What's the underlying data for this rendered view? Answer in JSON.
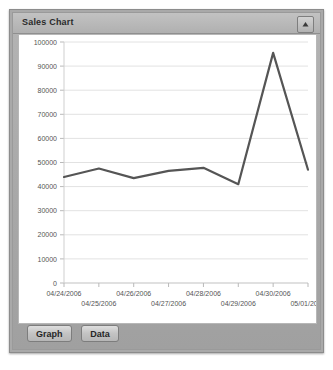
{
  "window": {
    "title": "Sales Chart",
    "collapse_icon": "collapse-up-icon"
  },
  "toolbar": {
    "graph_label": "Graph",
    "data_label": "Data"
  },
  "chart_data": {
    "type": "line",
    "title": "Sales Chart",
    "xlabel": "",
    "ylabel": "",
    "categories": [
      "04/24/2006",
      "04/25/2006",
      "04/26/2006",
      "04/27/2006",
      "04/28/2006",
      "04/29/2006",
      "04/30/2006",
      "05/01/2006"
    ],
    "values": [
      44000,
      47500,
      43500,
      46500,
      47800,
      41000,
      95500,
      47000
    ],
    "series": [
      {
        "name": "Sales",
        "values": [
          44000,
          47500,
          43500,
          46500,
          47800,
          41000,
          95500,
          47000
        ],
        "color": "#555555"
      }
    ],
    "ylim": [
      0,
      100000
    ],
    "ytick_step": 10000,
    "yticks": [
      0,
      10000,
      20000,
      30000,
      40000,
      50000,
      60000,
      70000,
      80000,
      90000,
      100000
    ],
    "ytick_labels": [
      "0",
      "10000",
      "20000",
      "30000",
      "40000",
      "50000",
      "60000",
      "70000",
      "80000",
      "90000",
      "100000"
    ],
    "grid": true,
    "legend": "none",
    "line_color": "#555555",
    "grid_color": "#e2e2e2",
    "axis_color": "#cfcfcf"
  }
}
